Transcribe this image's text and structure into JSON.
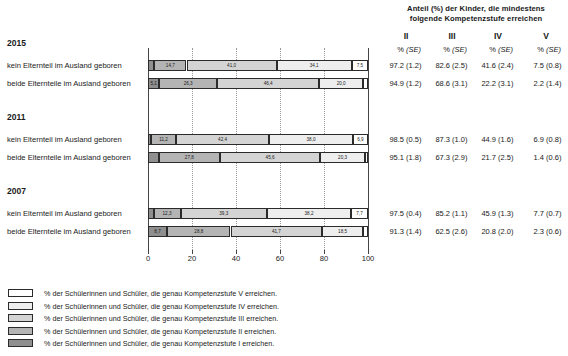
{
  "header": {
    "title_line1": "Anteil (%) der Kinder, die mindestens",
    "title_line2": "folgende Kompetenzstufe erreichen"
  },
  "table": {
    "level_headers": [
      "II",
      "III",
      "IV",
      "V"
    ],
    "sub_headers": {
      "pct": "%",
      "se": "(SE)"
    }
  },
  "axis": {
    "ticks": [
      0,
      20,
      40,
      60,
      80,
      100
    ],
    "tick_labels": [
      "0",
      "20",
      "40",
      "60",
      "80",
      "100"
    ],
    "min": 0,
    "max": 100
  },
  "colors": {
    "level_V": "#ffffff",
    "level_IV": "#eeeeee",
    "level_III": "#d4d4d4",
    "level_II": "#b4b4b4",
    "level_I": "#8f8f8f",
    "outline": "#2b2b2b",
    "grid": "#9a9a9a"
  },
  "groups": [
    {
      "year": "2015",
      "rows": [
        {
          "label": "kein Elternteil im Ausland geboren",
          "segments": [
            {
              "level": "I",
              "value": 2.8,
              "label": ""
            },
            {
              "level": "II",
              "value": 14.7,
              "label": "14,7"
            },
            {
              "level": "III",
              "value": 41.0,
              "label": "41,0"
            },
            {
              "level": "IV",
              "value": 34.1,
              "label": "34,1"
            },
            {
              "level": "V",
              "value": 7.5,
              "label": "7,5"
            }
          ],
          "values": [
            {
              "pct": "97.2",
              "se": "(1.2)"
            },
            {
              "pct": "82.6",
              "se": "(2.5)"
            },
            {
              "pct": "41.6",
              "se": "(2.4)"
            },
            {
              "pct": "7.5",
              "se": "(0.8)"
            }
          ]
        },
        {
          "label": "beide Elternteile im Ausland geboren",
          "segments": [
            {
              "level": "I",
              "value": 5.1,
              "label": "5,1"
            },
            {
              "level": "II",
              "value": 26.3,
              "label": "26,3"
            },
            {
              "level": "III",
              "value": 46.4,
              "label": "46,4"
            },
            {
              "level": "IV",
              "value": 20.0,
              "label": "20,0"
            },
            {
              "level": "V",
              "value": 2.2,
              "label": ""
            }
          ],
          "values": [
            {
              "pct": "94.9",
              "se": "(1.2)"
            },
            {
              "pct": "68.6",
              "se": "(3.1)"
            },
            {
              "pct": "22.2",
              "se": "(3.1)"
            },
            {
              "pct": "2.2",
              "se": "(1.4)"
            }
          ]
        }
      ]
    },
    {
      "year": "2011",
      "rows": [
        {
          "label": "kein Elternteil im Ausland geboren",
          "segments": [
            {
              "level": "I",
              "value": 1.5,
              "label": ""
            },
            {
              "level": "II",
              "value": 11.2,
              "label": "11,2"
            },
            {
              "level": "III",
              "value": 42.4,
              "label": "42,4"
            },
            {
              "level": "IV",
              "value": 38.0,
              "label": "38,0"
            },
            {
              "level": "V",
              "value": 6.9,
              "label": "6,9"
            }
          ],
          "values": [
            {
              "pct": "98.5",
              "se": "(0.5)"
            },
            {
              "pct": "87.3",
              "se": "(1.0)"
            },
            {
              "pct": "44.9",
              "se": "(1.6)"
            },
            {
              "pct": "6.9",
              "se": "(0.8)"
            }
          ]
        },
        {
          "label": "beide Elternteile im Ausland geboren",
          "segments": [
            {
              "level": "I",
              "value": 4.9,
              "label": ""
            },
            {
              "level": "II",
              "value": 27.8,
              "label": "27,8"
            },
            {
              "level": "III",
              "value": 45.6,
              "label": "45,6"
            },
            {
              "level": "IV",
              "value": 20.3,
              "label": "20,3"
            },
            {
              "level": "V",
              "value": 1.4,
              "label": ""
            }
          ],
          "values": [
            {
              "pct": "95.1",
              "se": "(1.8)"
            },
            {
              "pct": "67.3",
              "se": "(2.9)"
            },
            {
              "pct": "21.7",
              "se": "(2.5)"
            },
            {
              "pct": "1.4",
              "se": "(0.6)"
            }
          ]
        }
      ]
    },
    {
      "year": "2007",
      "rows": [
        {
          "label": "kein Elternteil im Ausland geboren",
          "segments": [
            {
              "level": "I",
              "value": 2.5,
              "label": ""
            },
            {
              "level": "II",
              "value": 12.3,
              "label": "12,3"
            },
            {
              "level": "III",
              "value": 39.3,
              "label": "39,3"
            },
            {
              "level": "IV",
              "value": 38.2,
              "label": "38,2"
            },
            {
              "level": "V",
              "value": 7.7,
              "label": "7,7"
            }
          ],
          "values": [
            {
              "pct": "97.5",
              "se": "(0.4)"
            },
            {
              "pct": "85.2",
              "se": "(1.1)"
            },
            {
              "pct": "45.9",
              "se": "(1.3)"
            },
            {
              "pct": "7.7",
              "se": "(0.7)"
            }
          ]
        },
        {
          "label": "beide Elternteile im Ausland geboren",
          "segments": [
            {
              "level": "I",
              "value": 8.7,
              "label": "8,7"
            },
            {
              "level": "II",
              "value": 28.8,
              "label": "28,8"
            },
            {
              "level": "III",
              "value": 41.7,
              "label": "41,7"
            },
            {
              "level": "IV",
              "value": 18.5,
              "label": "18,5"
            },
            {
              "level": "V",
              "value": 2.3,
              "label": ""
            }
          ],
          "values": [
            {
              "pct": "91.3",
              "se": "(1.4)"
            },
            {
              "pct": "62.5",
              "se": "(2.6)"
            },
            {
              "pct": "20.8",
              "se": "(2.0)"
            },
            {
              "pct": "2.3",
              "se": "(0.6)"
            }
          ]
        }
      ]
    }
  ],
  "legend": [
    {
      "level": "V",
      "text": "% der Schülerinnen und Schüler, die genau Kompetenzstufe V erreichen."
    },
    {
      "level": "IV",
      "text": "% der Schülerinnen und Schüler, die genau Kompetenzstufe IV erreichen."
    },
    {
      "level": "III",
      "text": "% der Schülerinnen und Schüler, die genau Kompetenzstufe III erreichen."
    },
    {
      "level": "II",
      "text": "% der Schülerinnen und Schüler, die genau Kompetenzstufe II erreichen."
    },
    {
      "level": "I",
      "text": "% der Schülerinnen und Schüler, die genau Kompetenzstufe I erreichen."
    }
  ],
  "chart_data": {
    "type": "bar",
    "orientation": "horizontal",
    "stacked": true,
    "title": "Anteil (%) der Kinder, die mindestens folgende Kompetenzstufe erreichen",
    "xlabel": "",
    "ylabel": "",
    "xlim": [
      0,
      100
    ],
    "grid": true,
    "legend_position": "bottom-left",
    "categories": [
      "2015 / kein Elternteil im Ausland geboren",
      "2015 / beide Elternteile im Ausland geboren",
      "2011 / kein Elternteil im Ausland geboren",
      "2011 / beide Elternteile im Ausland geboren",
      "2007 / kein Elternteil im Ausland geboren",
      "2007 / beide Elternteile im Ausland geboren"
    ],
    "series": [
      {
        "name": "Kompetenzstufe I",
        "values": [
          2.8,
          5.1,
          1.5,
          4.9,
          2.5,
          8.7
        ]
      },
      {
        "name": "Kompetenzstufe II",
        "values": [
          14.7,
          26.3,
          11.2,
          27.8,
          12.3,
          28.8
        ]
      },
      {
        "name": "Kompetenzstufe III",
        "values": [
          41.0,
          46.4,
          42.4,
          45.6,
          39.3,
          41.7
        ]
      },
      {
        "name": "Kompetenzstufe IV",
        "values": [
          34.1,
          20.0,
          38.0,
          20.3,
          38.2,
          18.5
        ]
      },
      {
        "name": "Kompetenzstufe V",
        "values": [
          7.5,
          2.2,
          6.9,
          1.4,
          7.7,
          2.3
        ]
      }
    ],
    "cumulative_table": {
      "columns": [
        "II",
        "III",
        "IV",
        "V"
      ],
      "rows": [
        {
          "category": "2015 / kein Elternteil im Ausland geboren",
          "pct": [
            97.2,
            82.6,
            41.6,
            7.5
          ],
          "se": [
            1.2,
            2.5,
            2.4,
            0.8
          ]
        },
        {
          "category": "2015 / beide Elternteile im Ausland geboren",
          "pct": [
            94.9,
            68.6,
            22.2,
            2.2
          ],
          "se": [
            1.2,
            3.1,
            3.1,
            1.4
          ]
        },
        {
          "category": "2011 / kein Elternteil im Ausland geboren",
          "pct": [
            98.5,
            87.3,
            44.9,
            6.9
          ],
          "se": [
            0.5,
            1.0,
            1.6,
            0.8
          ]
        },
        {
          "category": "2011 / beide Elternteile im Ausland geboren",
          "pct": [
            95.1,
            67.3,
            21.7,
            1.4
          ],
          "se": [
            1.8,
            2.9,
            2.5,
            0.6
          ]
        },
        {
          "category": "2007 / kein Elternteil im Ausland geboren",
          "pct": [
            97.5,
            85.2,
            45.9,
            7.7
          ],
          "se": [
            0.4,
            1.1,
            1.3,
            0.7
          ]
        },
        {
          "category": "2007 / beide Elternteile im Ausland geboren",
          "pct": [
            91.3,
            62.5,
            20.8,
            2.3
          ],
          "se": [
            1.4,
            2.6,
            2.0,
            0.6
          ]
        }
      ]
    }
  }
}
